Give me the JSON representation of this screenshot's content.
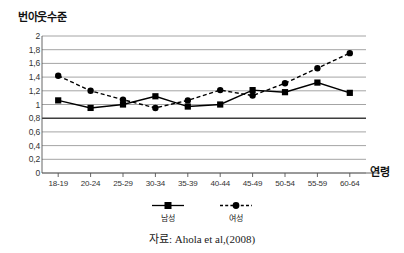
{
  "figure": {
    "y_axis_title": "번아웃수준",
    "x_axis_title": "연령",
    "caption": "자료: Ahola et al,(2008)"
  },
  "legend": {
    "items": [
      {
        "label": "남성",
        "style": "solid",
        "marker": "square",
        "color": "#000000"
      },
      {
        "label": "여성",
        "style": "dashed",
        "marker": "circle",
        "color": "#000000"
      }
    ]
  },
  "chart_data": {
    "type": "line",
    "title": "",
    "subtitle": "",
    "xlabel": "연령",
    "ylabel": "번아웃수준",
    "categories": [
      "18-19",
      "20-24",
      "25-29",
      "30-34",
      "35-39",
      "40-44",
      "45-49",
      "50-54",
      "55-59",
      "60-64"
    ],
    "ytick_labels": [
      "2",
      "1,8",
      "1,6",
      "1,4",
      "1,2",
      "1",
      "0,8",
      "0,6",
      "0,4",
      "0,2",
      "0"
    ],
    "ytick_values": [
      2,
      1.8,
      1.6,
      1.4,
      1.2,
      1,
      0.8,
      0.6,
      0.4,
      0.2,
      0
    ],
    "ylim": [
      0,
      2
    ],
    "grid": "horizontal",
    "emphasized_gridline": 0.8,
    "legend_position": "bottom-center",
    "series": [
      {
        "name": "남성",
        "style": "solid",
        "marker": "square",
        "color": "#000000",
        "values": [
          1.06,
          0.95,
          1.0,
          1.12,
          0.97,
          1.0,
          1.21,
          1.18,
          1.32,
          1.17
        ]
      },
      {
        "name": "여성",
        "style": "dashed",
        "marker": "circle",
        "color": "#000000",
        "values": [
          1.42,
          1.2,
          1.07,
          0.95,
          1.06,
          1.21,
          1.13,
          1.31,
          1.53,
          1.75
        ]
      }
    ]
  }
}
